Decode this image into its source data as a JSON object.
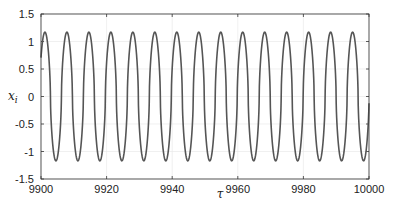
{
  "chart_data": {
    "type": "line",
    "title": "",
    "xlabel": "τ",
    "ylabel": "x_i",
    "xlim": [
      9900,
      10000
    ],
    "ylim": [
      -1.5,
      1.5
    ],
    "xticks": [
      9900,
      9920,
      9940,
      9960,
      9980,
      10000
    ],
    "xtick_labels": [
      "9900",
      "9920",
      "9940",
      "9960",
      "9980",
      "10000"
    ],
    "yticks": [
      1.5,
      1,
      0.5,
      0,
      -0.5,
      -1,
      -1.5
    ],
    "ytick_labels": [
      "1.5",
      "1",
      "0.5",
      "0",
      "-0.5",
      "-1",
      "-1.5"
    ],
    "grid": true,
    "legend": null,
    "series": [
      {
        "name": "x_i",
        "color": "#555555",
        "description": "periodic relaxation-like oscillation",
        "amplitude_max": 1.17,
        "amplitude_min": -1.17,
        "period": 6.7,
        "first_peak_x": 9901.2,
        "num_peaks": 15,
        "end_value": 0.0
      }
    ]
  },
  "colors": {
    "line": "#555555",
    "axis": "#333333",
    "grid": "#e6e6e6"
  }
}
